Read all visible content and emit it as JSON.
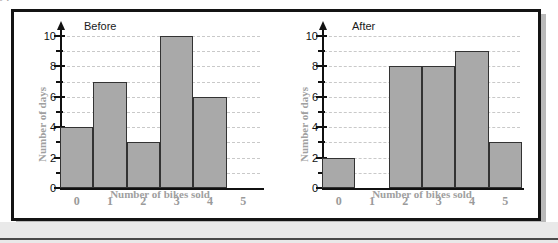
{
  "figure": {
    "top_fragment": "y                                p",
    "frame_color": "#141414",
    "background": "#ffffff"
  },
  "chart_data": [
    {
      "type": "bar",
      "title": "Before",
      "categories": [
        "0",
        "1",
        "2",
        "3",
        "4",
        "5"
      ],
      "values": [
        4,
        7,
        3,
        10,
        6
      ],
      "xlabel": "Number of bikes sold",
      "ylabel": "Number of days",
      "ylim": [
        0,
        10
      ],
      "yticks_major": [
        0,
        2,
        4,
        6,
        8,
        10
      ],
      "yticks_minor": [
        1,
        3,
        5,
        7,
        9
      ],
      "grid": true,
      "grid_color": "#c9c9c9",
      "bar_fill": "#a9a9a9",
      "bar_stroke": "#333333",
      "legend": "none"
    },
    {
      "type": "bar",
      "title": "After",
      "categories": [
        "0",
        "1",
        "2",
        "3",
        "4",
        "5"
      ],
      "values": [
        2,
        0,
        8,
        8,
        9,
        3
      ],
      "xlabel": "Number of bikes sold",
      "ylabel": "Number of days",
      "ylim": [
        0,
        10
      ],
      "yticks_major": [
        0,
        2,
        4,
        6,
        8,
        10
      ],
      "yticks_minor": [
        1,
        3,
        5,
        7,
        9
      ],
      "grid": true,
      "grid_color": "#c9c9c9",
      "bar_fill": "#a9a9a9",
      "bar_stroke": "#333333",
      "legend": "none"
    }
  ]
}
